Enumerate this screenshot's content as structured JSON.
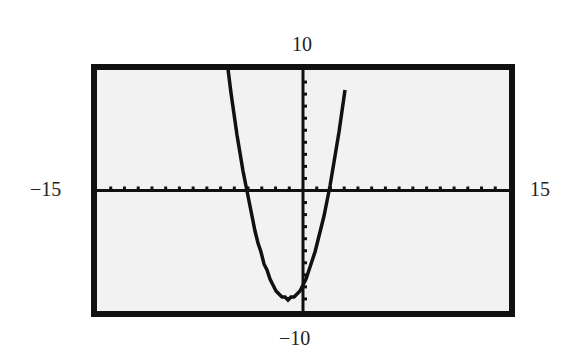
{
  "chart_data": {
    "type": "line",
    "title": "",
    "xlabel": "",
    "ylabel": "",
    "xlim": [
      -15,
      15
    ],
    "ylim": [
      -10,
      10
    ],
    "grid": false,
    "axes_ticks": {
      "x_step": 1,
      "y_step": 1
    },
    "window_labels": {
      "xmin": "−15",
      "xmax": "15",
      "ymin": "−10",
      "ymax": "10"
    },
    "series": [
      {
        "name": "y = x^2 + 2x - 8",
        "equation": "y = x^2 + 2x - 8",
        "roots": [
          -4,
          2
        ],
        "vertex": [
          -1,
          -9
        ],
        "y_intercept": -8,
        "x": [
          -5.36,
          -5,
          -4,
          -3,
          -2,
          -1,
          0,
          1,
          2,
          3,
          3.36
        ],
        "y": [
          10,
          7,
          0,
          -5,
          -8,
          -9,
          -8,
          -5,
          0,
          7,
          10
        ]
      }
    ],
    "colors": {
      "background": "#f2f2f2",
      "frame": "#111111",
      "curve": "#111111"
    }
  }
}
